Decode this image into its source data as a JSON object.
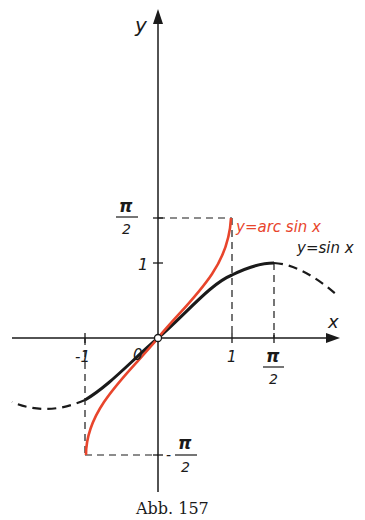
{
  "figure": {
    "caption": "Abb. 157",
    "axes": {
      "x_label": "x",
      "y_label": "y",
      "x_ticks": [
        {
          "label": "-1",
          "value": -1
        },
        {
          "label": "1",
          "value": 1
        },
        {
          "label_num": "π",
          "label_den": "2",
          "value": 1.5708
        }
      ],
      "y_ticks": [
        {
          "label": "1",
          "value": 1
        },
        {
          "label_num": "π",
          "label_den": "2",
          "value": 1.5708
        },
        {
          "label_prefix": "-",
          "label_num": "π",
          "label_den": "2",
          "value": -1.5708
        }
      ],
      "origin_label": "0"
    },
    "curves": [
      {
        "name": "sin",
        "label": "y=sin x",
        "color": "#1a1a1a",
        "solid_domain": [
          -1,
          1.5708
        ],
        "dashed_beyond": true
      },
      {
        "name": "arcsin",
        "label": "y=arc sin x",
        "color": "#e8452c",
        "domain": [
          -1,
          1
        ]
      }
    ],
    "colors": {
      "ink": "#1a1a1a",
      "accent": "#e8452c",
      "background": "#ffffff"
    }
  }
}
